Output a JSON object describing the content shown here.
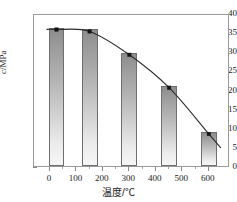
{
  "chart_data": {
    "type": "bar",
    "title": "",
    "subtitle": "",
    "xlabel": "温度/℃",
    "ylabel": "c/MPa",
    "xlim": [
      -60,
      680
    ],
    "ylim": [
      0,
      40
    ],
    "xticks": [
      0,
      100,
      200,
      300,
      400,
      500,
      600
    ],
    "yticks": [
      0,
      5,
      10,
      15,
      20,
      25,
      30,
      35,
      40
    ],
    "grid": false,
    "legend": null,
    "categories": [
      25,
      150,
      300,
      450,
      600
    ],
    "values": [
      36.2,
      35.7,
      29.6,
      21.0,
      8.9
    ],
    "bar_width": 60,
    "series": [
      {
        "name": "bar-series",
        "type": "bar",
        "x": [
          25,
          150,
          300,
          450,
          600
        ],
        "values": [
          36.2,
          35.7,
          29.6,
          21.0,
          8.9
        ]
      },
      {
        "name": "trend-curve",
        "type": "line",
        "x": [
          25,
          150,
          300,
          450,
          600
        ],
        "values": [
          36.2,
          35.7,
          29.6,
          21.0,
          8.9
        ],
        "markers": "filled-square"
      }
    ],
    "xtick_labels": [
      "0",
      "100",
      "200",
      "300",
      "400",
      "500",
      "600"
    ],
    "ytick_labels": [
      "0",
      "5",
      "10",
      "15",
      "20",
      "25",
      "30",
      "35",
      "40"
    ]
  },
  "axes": {
    "y_label_prefix": "c",
    "y_label_suffix": "/MPa",
    "x_label": "温度/℃"
  },
  "colors": {
    "bar_top": "#8d8d8d",
    "bar_bottom": "#f6f6f6",
    "bar_border": "#6e6e6e",
    "curve": "#2b2b2b",
    "marker": "#141414",
    "frame": "#9a9a9a",
    "text": "#1a1a1a",
    "background": "#ffffff"
  }
}
